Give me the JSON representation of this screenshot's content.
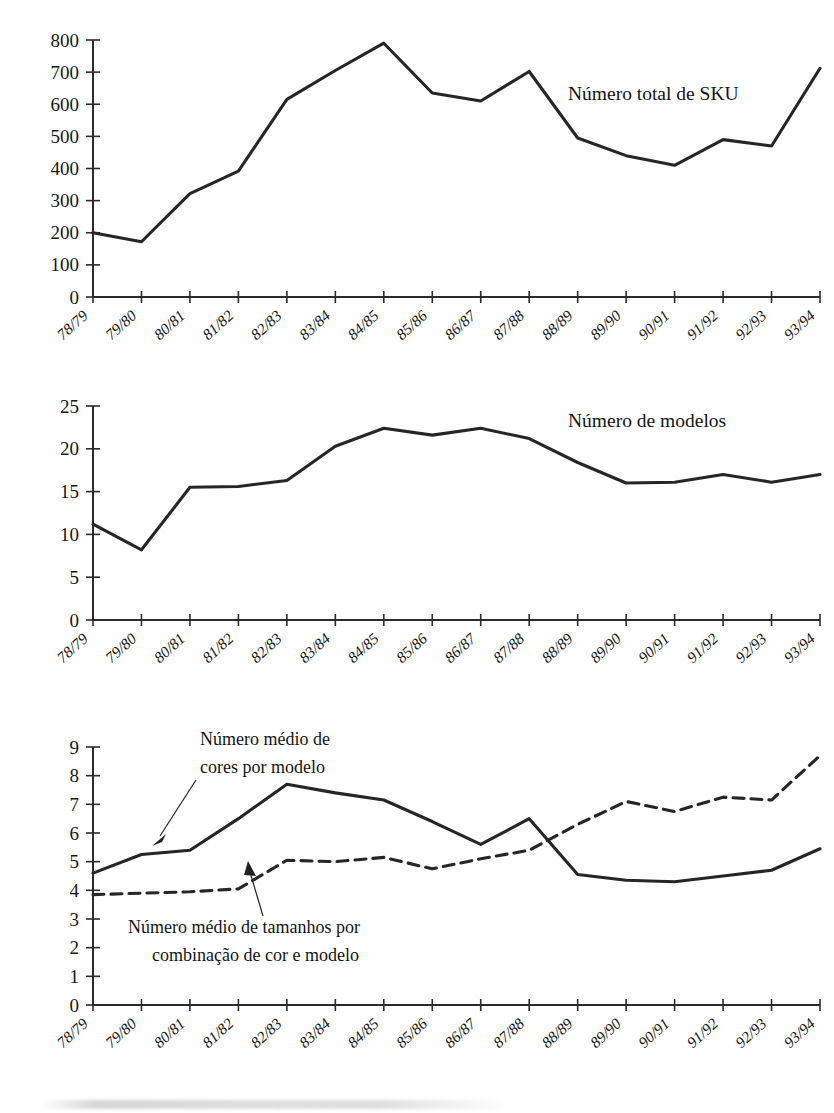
{
  "figure": {
    "categories": [
      "78/79",
      "79/80",
      "80/81",
      "81/82",
      "82/83",
      "83/84",
      "84/85",
      "85/86",
      "86/87",
      "87/88",
      "88/89",
      "89/90",
      "90/91",
      "91/92",
      "92/93",
      "93/94"
    ],
    "line_color": "#262626",
    "axis_color": "#2b2b2b"
  },
  "chart_data": [
    {
      "type": "line",
      "title": "",
      "xlabel": "",
      "ylabel": "",
      "ylim": [
        0,
        800
      ],
      "yticks": [
        0,
        100,
        200,
        300,
        400,
        500,
        600,
        700,
        800
      ],
      "grid": false,
      "legend_position": "inline-right",
      "categories": [
        "78/79",
        "79/80",
        "80/81",
        "81/82",
        "82/83",
        "83/84",
        "84/85",
        "85/86",
        "86/87",
        "87/88",
        "88/89",
        "89/90",
        "90/91",
        "91/92",
        "92/93",
        "93/94"
      ],
      "series": [
        {
          "name": "Número total de SKU",
          "style": "solid",
          "values": [
            200,
            172,
            322,
            392,
            615,
            705,
            790,
            635,
            610,
            702,
            495,
            440,
            410,
            490,
            470,
            712
          ]
        }
      ]
    },
    {
      "type": "line",
      "title": "",
      "xlabel": "",
      "ylabel": "",
      "ylim": [
        0,
        25
      ],
      "yticks": [
        0,
        5,
        10,
        15,
        20,
        25
      ],
      "grid": false,
      "legend_position": "inline-right",
      "categories": [
        "78/79",
        "79/80",
        "80/81",
        "81/82",
        "82/83",
        "83/84",
        "84/85",
        "85/86",
        "86/87",
        "87/88",
        "88/89",
        "89/90",
        "90/91",
        "91/92",
        "92/93",
        "93/94"
      ],
      "series": [
        {
          "name": "Número de modelos",
          "style": "solid",
          "values": [
            11.2,
            8.2,
            15.5,
            15.6,
            16.3,
            20.3,
            22.4,
            21.6,
            22.4,
            21.2,
            18.4,
            16.0,
            16.1,
            17.0,
            16.1,
            17.0
          ]
        }
      ]
    },
    {
      "type": "line",
      "title": "",
      "xlabel": "",
      "ylabel": "",
      "ylim": [
        0,
        9
      ],
      "yticks": [
        0,
        1,
        2,
        3,
        4,
        5,
        6,
        7,
        8,
        9
      ],
      "grid": false,
      "legend_position": "annotations-with-leader-lines",
      "categories": [
        "78/79",
        "79/80",
        "80/81",
        "81/82",
        "82/83",
        "83/84",
        "84/85",
        "85/86",
        "86/87",
        "87/88",
        "88/89",
        "89/90",
        "90/91",
        "91/92",
        "92/93",
        "93/94"
      ],
      "series": [
        {
          "name": "Número médio de cores por modelo",
          "style": "solid",
          "values": [
            4.6,
            5.25,
            5.4,
            6.5,
            7.7,
            7.4,
            7.15,
            6.4,
            5.6,
            6.5,
            4.55,
            4.35,
            4.3,
            4.5,
            4.7,
            5.45
          ]
        },
        {
          "name": "Número médio de tamanhos por combinação de cor e modelo",
          "style": "dashed",
          "values": [
            3.85,
            3.9,
            3.95,
            4.05,
            5.05,
            5.0,
            5.15,
            4.75,
            5.1,
            5.4,
            6.3,
            7.1,
            6.75,
            7.25,
            7.15,
            8.7
          ]
        }
      ]
    }
  ],
  "panel1": {
    "series_label": "Número total de SKU"
  },
  "panel2": {
    "series_label": "Número de modelos"
  },
  "panel3": {
    "annotation_solid_line1": "Número médio de",
    "annotation_solid_line2": "cores por modelo",
    "annotation_dashed_line1": "Número médio de tamanhos por",
    "annotation_dashed_line2": "combinação de cor e modelo"
  }
}
